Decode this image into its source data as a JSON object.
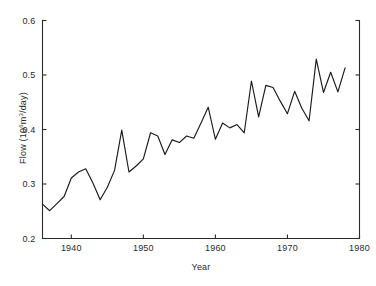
{
  "chart_data": {
    "type": "line",
    "title": "",
    "subtitle": "",
    "xlabel": "Year",
    "ylabel": "Flow (10⁶m³/day)",
    "ylabel_parts": {
      "prefix": "Flow (10",
      "exponent_1": "6",
      "middle": "m",
      "exponent_2": "3",
      "suffix": "/day)"
    },
    "xlim": [
      1936,
      1980
    ],
    "ylim": [
      0.2,
      0.6
    ],
    "xticks": [
      1940,
      1950,
      1960,
      1970,
      1980
    ],
    "xtick_labels": [
      "1940",
      "1950",
      "1960",
      "1970",
      "1980"
    ],
    "yticks": [
      0.2,
      0.3,
      0.4,
      0.5,
      0.6
    ],
    "ytick_labels": [
      "0.2",
      "0.3",
      "0.4",
      "0.5",
      "0.6"
    ],
    "grid": false,
    "legend": false,
    "legend_position": "none",
    "line_color": "#1a1a1a",
    "axis_color": "#2b2b2b",
    "background_color": "#ffffff",
    "tick_direction": "in",
    "spines": [
      "left",
      "bottom",
      "right"
    ],
    "x": [
      1936,
      1937,
      1938,
      1939,
      1940,
      1941,
      1942,
      1943,
      1944,
      1945,
      1946,
      1947,
      1948,
      1949,
      1950,
      1951,
      1952,
      1953,
      1954,
      1955,
      1956,
      1957,
      1958,
      1959,
      1960,
      1961,
      1962,
      1963,
      1964,
      1965,
      1966,
      1967,
      1968,
      1969,
      1970,
      1971,
      1972,
      1973,
      1974,
      1975,
      1976,
      1977,
      1978
    ],
    "values": [
      0.263,
      0.251,
      0.264,
      0.277,
      0.311,
      0.322,
      0.328,
      0.302,
      0.271,
      0.294,
      0.325,
      0.399,
      0.322,
      0.333,
      0.346,
      0.394,
      0.388,
      0.354,
      0.381,
      0.376,
      0.388,
      0.384,
      0.412,
      0.441,
      0.382,
      0.412,
      0.403,
      0.409,
      0.394,
      0.489,
      0.423,
      0.481,
      0.477,
      0.452,
      0.429,
      0.47,
      0.439,
      0.416,
      0.529,
      0.468,
      0.505,
      0.469,
      0.513
    ],
    "series": [
      {
        "name": "Flow",
        "values": [
          0.263,
          0.251,
          0.264,
          0.277,
          0.311,
          0.322,
          0.328,
          0.302,
          0.271,
          0.294,
          0.325,
          0.399,
          0.322,
          0.333,
          0.346,
          0.394,
          0.388,
          0.354,
          0.381,
          0.376,
          0.388,
          0.384,
          0.412,
          0.441,
          0.382,
          0.412,
          0.403,
          0.409,
          0.394,
          0.489,
          0.423,
          0.481,
          0.477,
          0.452,
          0.429,
          0.47,
          0.439,
          0.416,
          0.529,
          0.468,
          0.505,
          0.469,
          0.513
        ]
      }
    ]
  }
}
